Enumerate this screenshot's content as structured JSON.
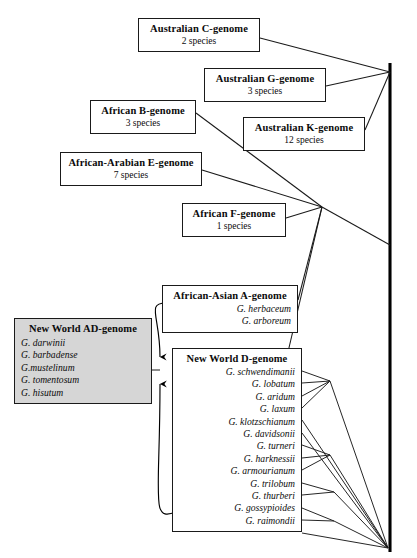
{
  "diagram": {
    "root_label": "",
    "nodes": [
      {
        "id": "c",
        "title": "Australian C-genome",
        "subtitle": "2 species",
        "species": [],
        "shaded": false
      },
      {
        "id": "g",
        "title": "Australian G-genome",
        "subtitle": "3 species",
        "species": [],
        "shaded": false
      },
      {
        "id": "b",
        "title": "African B-genome",
        "subtitle": "3 species",
        "species": [],
        "shaded": false
      },
      {
        "id": "k",
        "title": "Australian K-genome",
        "subtitle": "12 species",
        "species": [],
        "shaded": false
      },
      {
        "id": "e",
        "title": "African-Arabian E-genome",
        "subtitle": "7 species",
        "species": [],
        "shaded": false
      },
      {
        "id": "f",
        "title": "African F-genome",
        "subtitle": "1 species",
        "species": [],
        "shaded": false
      },
      {
        "id": "a",
        "title": "African-Asian A-genome",
        "subtitle": "",
        "species": [
          "G. herbaceum",
          "G. arboreum"
        ],
        "shaded": false
      },
      {
        "id": "ad",
        "title": "New World AD-genome",
        "subtitle": "",
        "species": [
          "G. darwinii",
          "G. barbadense",
          "G.mustelinum",
          "G. tomentosum",
          "G. hisutum"
        ],
        "shaded": true
      },
      {
        "id": "d",
        "title": "New World D-genome",
        "subtitle": "",
        "species": [
          "G. schwendimanii",
          "G. lobatum",
          "G. aridum",
          "G. laxum",
          "G. klotzschianum",
          "G. davidsonii",
          "G. turneri",
          "G. harknessii",
          "G. armourianum",
          "G. trilobum",
          "G. thurberi",
          "G. gossypioides",
          "G. raimondii"
        ],
        "shaded": false
      }
    ],
    "colors": {
      "line": "#1a1a1a",
      "shaded_fill": "#d6d6d6",
      "box_fill": "#ffffff",
      "backbone": "#000000"
    }
  }
}
